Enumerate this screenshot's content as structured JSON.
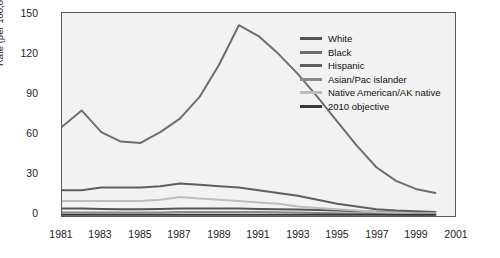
{
  "chart_data": {
    "type": "line",
    "title": "",
    "xlabel": "",
    "ylabel": "Rate (per 100,000 population)",
    "xlim": [
      1981,
      2001
    ],
    "ylim": [
      0,
      150
    ],
    "ytick_labels": [
      "0",
      "30",
      "60",
      "90",
      "120",
      "150"
    ],
    "yticks": [
      0,
      30,
      60,
      90,
      120,
      150
    ],
    "xtick_labels": [
      "1981",
      "1983",
      "1985",
      "1987",
      "1989",
      "1991",
      "1993",
      "1995",
      "1997",
      "1999",
      "2001"
    ],
    "xticks": [
      1981,
      1983,
      1985,
      1987,
      1989,
      1991,
      1993,
      1995,
      1997,
      1999,
      2001
    ],
    "grid": false,
    "legend_position": "upper right",
    "x": [
      1981,
      1982,
      1983,
      1984,
      1985,
      1986,
      1987,
      1988,
      1989,
      1990,
      1991,
      1992,
      1993,
      1994,
      1995,
      1996,
      1997,
      1998,
      1999,
      2000
    ],
    "series": [
      {
        "name": "White",
        "color": "#555555",
        "values": [
          5.5,
          5.5,
          5.2,
          5.0,
          5.0,
          5.2,
          5.5,
          5.5,
          5.5,
          5.5,
          5.2,
          5.0,
          4.8,
          4.5,
          4.0,
          3.5,
          3.2,
          3.0,
          3.0,
          3.0
        ]
      },
      {
        "name": "Black",
        "color": "#6e6e6e",
        "values": [
          66,
          78,
          62,
          55,
          54,
          62,
          72,
          88,
          112,
          141,
          133,
          120,
          105,
          88,
          70,
          52,
          36,
          26,
          20,
          17
        ]
      },
      {
        "name": "Hispanic",
        "color": "#5f5f5f",
        "values": [
          19,
          19,
          21,
          21,
          21,
          22,
          24,
          23,
          22,
          21,
          19,
          17,
          15,
          12,
          9,
          7,
          5,
          4,
          3.5,
          3
        ]
      },
      {
        "name": "Asian/Pac islander",
        "color": "#8a8a8a",
        "values": [
          2.5,
          2.5,
          2.5,
          2.5,
          2.5,
          2.5,
          3.0,
          3.0,
          3.0,
          3.0,
          3.0,
          2.8,
          2.5,
          2.2,
          2.0,
          1.8,
          1.5,
          1.2,
          1.0,
          1.0
        ]
      },
      {
        "name": "Native American/AK native",
        "color": "#bdbdbd",
        "values": [
          11,
          11,
          11,
          11,
          11,
          12,
          14,
          13,
          12,
          11,
          10,
          9,
          7,
          6,
          5,
          4,
          3,
          2.5,
          2,
          2
        ]
      },
      {
        "name": "2010 objective",
        "color": "#3a3a3a",
        "values": [
          1,
          1,
          1,
          1,
          1,
          1,
          1,
          1,
          1,
          1,
          1,
          1,
          1,
          1,
          1,
          1,
          1,
          1,
          1,
          1
        ]
      }
    ]
  },
  "legend": {
    "items": [
      {
        "label": "White"
      },
      {
        "label": "Black"
      },
      {
        "label": "Hispanic"
      },
      {
        "label": "Asian/Pac islander"
      },
      {
        "label": "Native American/AK native"
      },
      {
        "label": "2010 objective"
      }
    ]
  }
}
